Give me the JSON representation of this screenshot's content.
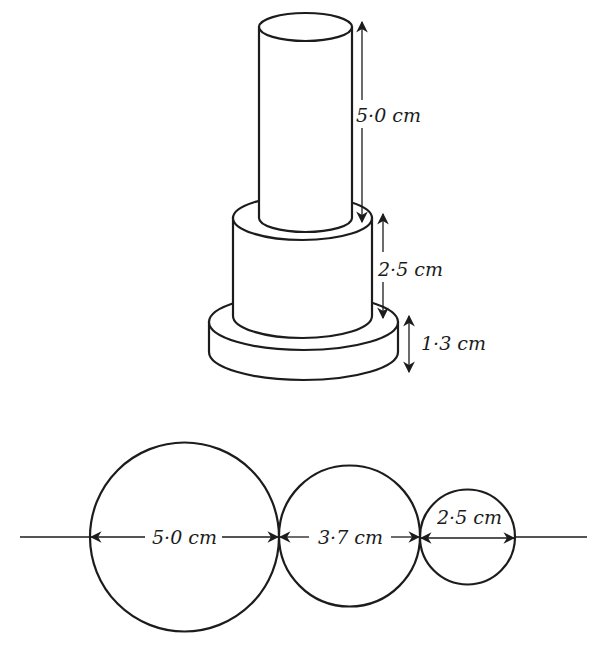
{
  "figure": {
    "stacked_cylinders": {
      "top": {
        "height_label": "5·0 cm"
      },
      "middle": {
        "height_label": "2·5 cm"
      },
      "base": {
        "height_label": "1·3 cm"
      }
    },
    "circles": [
      {
        "diameter_label": "5·0 cm"
      },
      {
        "diameter_label": "3·7 cm"
      },
      {
        "diameter_label": "2·5 cm"
      }
    ],
    "colors": {
      "ink": "#1c1c1c",
      "background": "#ffffff"
    }
  }
}
